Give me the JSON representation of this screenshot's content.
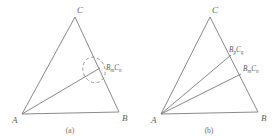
{
  "figure": {
    "background_color": "#ffffff",
    "stroke_color": "#7a7a7a",
    "stroke_color_dark": "#6b6b6b",
    "text_color": "#5d5d5d",
    "panels": [
      {
        "id": "a",
        "caption": "(a)",
        "vertices": {
          "A": {
            "label": "A",
            "x": 22,
            "y": 114
          },
          "B": {
            "label": "B",
            "x": 119,
            "y": 112
          },
          "C": {
            "label": "C",
            "x": 75,
            "y": 17
          }
        },
        "cevian_points": [
          {
            "label_main_1": "B",
            "label_sub_1": "m",
            "label_main_2": "C",
            "label_sub_2": "n",
            "x": 98,
            "y": 69
          }
        ],
        "annotation": {
          "type": "dashed-ellipse",
          "cx": 94,
          "cy": 70,
          "rx": 11,
          "ry": 13,
          "rotation": -20
        }
      },
      {
        "id": "b",
        "caption": "(b)",
        "vertices": {
          "A": {
            "label": "A",
            "x": 22,
            "y": 114
          },
          "B": {
            "label": "B",
            "x": 119,
            "y": 112
          },
          "C": {
            "label": "C",
            "x": 71,
            "y": 17
          }
        },
        "cevian_points": [
          {
            "label_main_1": "B",
            "label_sub_1": "p",
            "label_main_2": "C",
            "label_sub_2": "q",
            "x": 90,
            "y": 52
          },
          {
            "label_main_1": "B",
            "label_sub_1": "m",
            "label_sub_2": "n",
            "label_main_2": "C",
            "x": 101,
            "y": 71
          }
        ]
      }
    ]
  }
}
